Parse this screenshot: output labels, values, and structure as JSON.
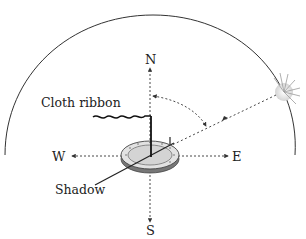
{
  "diagram": {
    "title": "",
    "labels": {
      "north": "N",
      "south": "S",
      "east": "E",
      "west": "W",
      "cloth_ribbon": "Cloth ribbon",
      "shadow": "Shadow"
    },
    "elements": {
      "sky_dome": "hemisphere arc",
      "sun": "sun-icon",
      "device": "sundial disc with vertical pole and gnomon",
      "sun_ray": "dashed line from sun to device",
      "angle_arc": "dashed arc between north axis and sun ray"
    },
    "colors": {
      "line": "#333333",
      "disc_fill": "#d9d9d9",
      "disc_rim": "#555555",
      "sun": "#e8e8e8"
    }
  }
}
